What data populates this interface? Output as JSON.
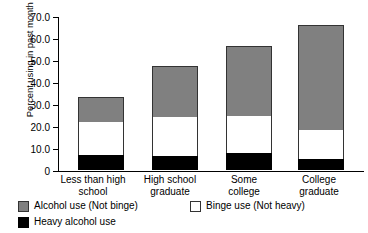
{
  "chart_data": {
    "type": "bar",
    "subtype": "stacked-bar",
    "title": "",
    "xlabel": "",
    "ylabel": "Percent using in past month",
    "ylim": [
      0,
      70
    ],
    "grid": false,
    "legend_position": "bottom",
    "categories": [
      "Less than high\nschool",
      "High school\ngraduate",
      "Some\ncollege",
      "College\ngraduate"
    ],
    "ytick_labels": [
      "70.0",
      "60.0",
      "50.0",
      "40.0",
      "30.0",
      "20.0",
      "10.0",
      "0"
    ],
    "ytick_values": [
      70,
      60,
      50,
      40,
      30,
      20,
      10,
      0
    ],
    "series": [
      {
        "name": "Heavy alcohol use",
        "color": "#000000",
        "values": [
          6.8,
          6.4,
          7.7,
          5.0
        ]
      },
      {
        "name": "Binge use (Not heavy)",
        "color": "#FFFFFF",
        "values": [
          15.0,
          17.7,
          16.8,
          13.2
        ]
      },
      {
        "name": "Alcohol use (Not binge)",
        "color": "#808080",
        "values": [
          11.4,
          23.2,
          31.9,
          47.7
        ]
      }
    ],
    "cumulative_tops": {
      "heavy": [
        6.8,
        6.4,
        7.7,
        5.0
      ],
      "binge": [
        21.8,
        24.1,
        24.5,
        18.2
      ],
      "total": [
        33.2,
        47.3,
        56.4,
        65.9
      ]
    },
    "legend": [
      {
        "label": "Alcohol use (Not binge)",
        "swatch": "gray"
      },
      {
        "label": "Binge use (Not heavy)",
        "swatch": "white"
      },
      {
        "label": "Heavy alcohol use",
        "swatch": "black"
      }
    ]
  }
}
